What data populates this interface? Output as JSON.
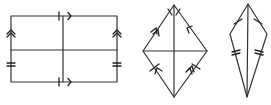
{
  "diagram": {
    "type": "quadrilaterals-with-diagonals-markings",
    "stroke_color": "#333333",
    "background": "#ffffff",
    "figures": [
      {
        "name": "rectangle",
        "description": "Rectangle with midlines; opposite sides marked parallel (arrows) and equal (tick marks)",
        "markings": {
          "top_bottom": "single tick + single arrow",
          "left_right": "double arrow + double tick"
        }
      },
      {
        "name": "rhombus",
        "description": "Rhombus with both diagonals; sides marked with ticks and arrows",
        "markings": {
          "upper_left": "double arrow + single tick",
          "upper_right": "single arrow + single tick",
          "lower_left": "single arrow + single tick",
          "lower_right": "double arrow + single tick"
        }
      },
      {
        "name": "kite",
        "description": "Kite with vertical diagonal; upper sides single tick, lower sides double tick",
        "markings": {
          "upper_sides": "single tick",
          "lower_sides": "double tick"
        }
      }
    ]
  }
}
